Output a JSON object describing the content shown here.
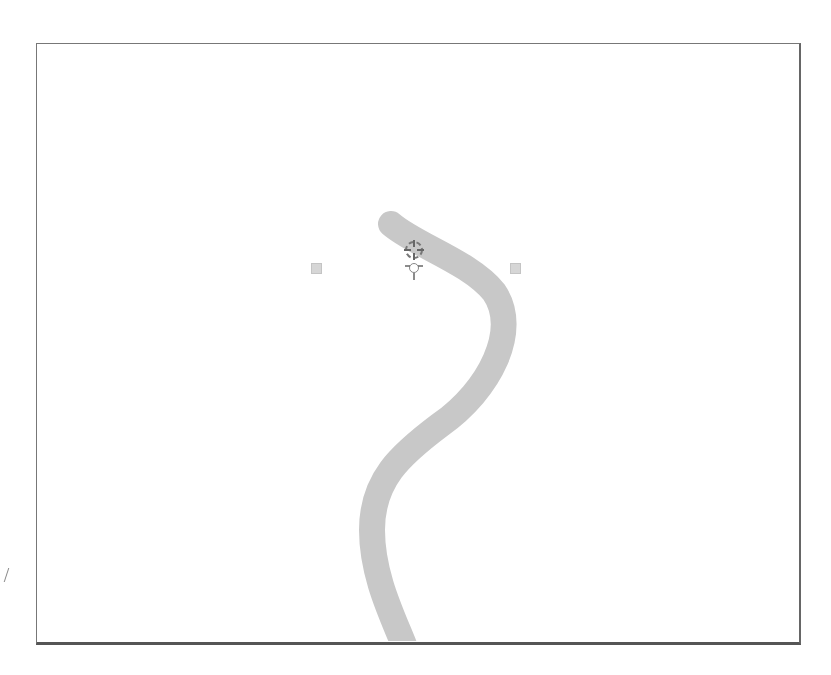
{
  "canvas": {
    "background": "#ffffff",
    "frame_color": "#666666"
  },
  "stroke": {
    "color": "#c8c8c8",
    "width": 26,
    "path": "M391,224 C415,245 470,262 494,292 C520,330 490,390 440,425 C400,455 372,480 372,530 C372,575 392,615 404,645"
  },
  "handles": [
    {
      "name": "left-control-handle",
      "x": 311,
      "y": 263
    },
    {
      "name": "right-control-handle",
      "x": 510,
      "y": 263
    }
  ],
  "cursor": {
    "icon": "move-crosshair-icon",
    "x": 414,
    "y": 250
  }
}
